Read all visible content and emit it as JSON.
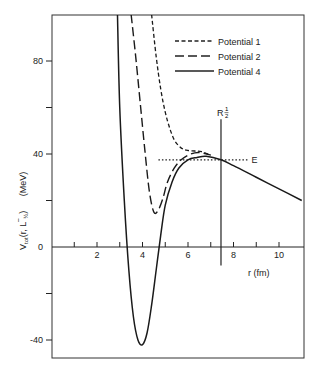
{
  "chart_data": {
    "type": "line",
    "title": "",
    "xlabel": "r (fm)",
    "ylabel": "V_tot (r, L̄_1/2)   (MeV)",
    "xlim": [
      0,
      11
    ],
    "ylim": [
      -48,
      100
    ],
    "x_ticks": [
      1,
      2,
      3,
      4,
      5,
      6,
      7,
      8,
      9,
      10
    ],
    "x_tick_labels": [
      "2",
      "4",
      "6",
      "8",
      "10"
    ],
    "x_tick_label_values": [
      2,
      4,
      6,
      8,
      10
    ],
    "y_ticks": [
      -20,
      20,
      40,
      60,
      80,
      -40
    ],
    "y_tick_labels": [
      "80",
      "40",
      "0",
      "-40"
    ],
    "y_tick_label_values": [
      80,
      40,
      0,
      -40
    ],
    "grid": false,
    "legend_position": "upper right",
    "series": [
      {
        "name": "Potential 1",
        "style": "short-dash",
        "x": [
          4.4,
          4.6,
          4.8,
          5.0,
          5.2,
          5.4,
          5.6,
          5.8,
          6.0,
          6.3,
          6.6,
          7.0
        ],
        "y": [
          100,
          82,
          68,
          58,
          51,
          46,
          43.5,
          42,
          41.5,
          41.3,
          41,
          39.5
        ]
      },
      {
        "name": "Potential 2",
        "style": "long-dash",
        "x": [
          3.5,
          3.7,
          3.9,
          4.1,
          4.3,
          4.5,
          4.7,
          4.9,
          5.1,
          5.4,
          5.7,
          6.0,
          6.3,
          6.6,
          7.0
        ],
        "y": [
          100,
          82,
          62,
          42,
          24,
          15,
          16,
          21,
          28,
          34,
          37.5,
          39.5,
          40.5,
          40.5,
          39.5
        ]
      },
      {
        "name": "Potential 4",
        "style": "solid",
        "x": [
          2.9,
          3.0,
          3.2,
          3.4,
          3.6,
          3.8,
          4.0,
          4.2,
          4.4,
          4.6,
          4.8,
          5.0,
          5.3,
          5.6,
          6.0,
          6.4,
          6.8,
          7.45,
          8.0,
          9.0,
          10.0,
          11.0
        ],
        "y": [
          100,
          60,
          20,
          -10,
          -30,
          -40,
          -42,
          -37,
          -25,
          -10,
          5,
          18,
          28,
          34,
          37.5,
          38.5,
          39,
          37.5,
          35,
          30,
          25,
          20
        ]
      }
    ],
    "annotations": [
      {
        "text": "E",
        "type": "horizontal-dotted-line",
        "y": 37.5,
        "x_range": [
          4.7,
          8.7
        ]
      },
      {
        "text": "R_1/2",
        "type": "vertical-line",
        "x": 7.45,
        "y_range": [
          -8,
          55
        ]
      }
    ]
  },
  "labels": {
    "y_axis_title": "V",
    "y_axis_sub": "tot",
    "y_axis_args": "(r, L",
    "y_axis_args_end": ")",
    "y_axis_unit": "(MeV)",
    "x_axis_title": "r (fm)",
    "e_label": "E",
    "r_half_label": "R",
    "r_half_num": "1",
    "r_half_den": "2"
  },
  "legend": {
    "items": [
      {
        "label": "Potential 1"
      },
      {
        "label": "Potential 2"
      },
      {
        "label": "Potential 4"
      }
    ]
  }
}
